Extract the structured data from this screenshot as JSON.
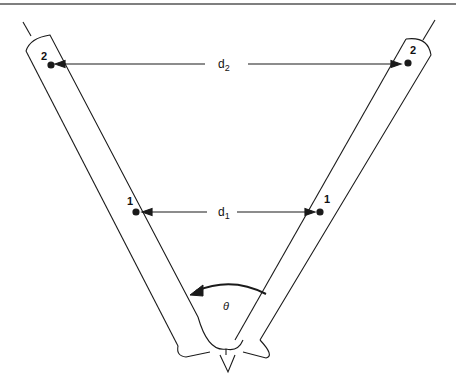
{
  "diagram": {
    "labels": {
      "point_left_top": "2",
      "point_right_top": "2",
      "point_left_mid": "1",
      "point_right_mid": "1",
      "distance_top": "d",
      "distance_top_sub": "2",
      "distance_mid": "d",
      "distance_mid_sub": "1",
      "angle": "θ"
    },
    "colors": {
      "stroke": "#1a1a1a",
      "rule": "#555555",
      "background": "#ffffff"
    }
  }
}
